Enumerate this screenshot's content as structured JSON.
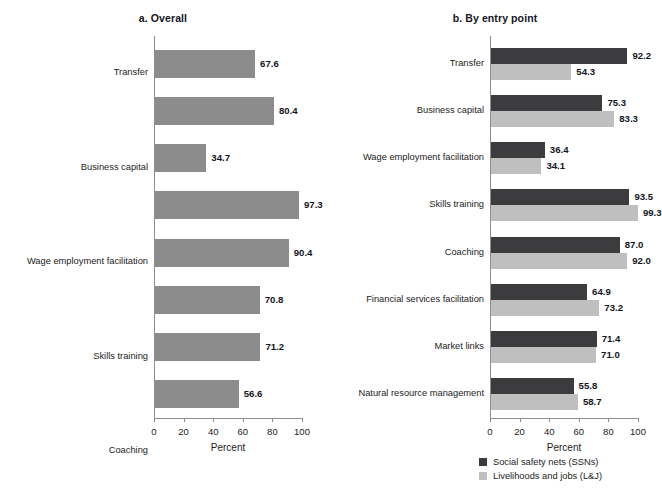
{
  "chart_data": [
    {
      "type": "bar",
      "panel_id": "a",
      "title": "a. Overall",
      "xlabel": "Percent",
      "ylabel": "",
      "xlim": [
        0,
        100
      ],
      "xticks": [
        0,
        20,
        40,
        60,
        80,
        100
      ],
      "xticklabels": [
        "0",
        "20",
        "40",
        "60",
        "80",
        "100"
      ],
      "grid": false,
      "orientation": "horizontal",
      "legend": false,
      "categories": [
        "Transfer",
        "Business capital",
        "Wage employment facilitation",
        "Skills training",
        "Coaching",
        "Financial services facilitation",
        "Market links",
        "Natural resource management"
      ],
      "values": [
        67.6,
        80.4,
        34.7,
        97.3,
        90.4,
        70.8,
        71.2,
        56.6
      ],
      "datalabels": [
        "67.6",
        "80.4",
        "34.7",
        "97.3",
        "90.4",
        "70.8",
        "71.2",
        "56.6"
      ],
      "bar_color": "#8c8c8c"
    },
    {
      "type": "bar",
      "panel_id": "b",
      "title": "b. By entry point",
      "xlabel": "Percent",
      "ylabel": "",
      "xlim": [
        0,
        100
      ],
      "xticks": [
        0,
        20,
        40,
        60,
        80,
        100
      ],
      "xticklabels": [
        "0",
        "20",
        "40",
        "60",
        "80",
        "100"
      ],
      "grid": false,
      "orientation": "horizontal",
      "legend": true,
      "legend_position": "bottom-right",
      "categories": [
        "Transfer",
        "Business capital",
        "Wage employment facilitation",
        "Skills training",
        "Coaching",
        "Financial services facilitation",
        "Market links",
        "Natural resource management"
      ],
      "series": [
        {
          "name": "Social safety nets (SSNs)",
          "color": "#3c3c3f",
          "values": [
            92.2,
            75.3,
            36.4,
            93.5,
            87.0,
            64.9,
            71.4,
            55.8
          ],
          "datalabels": [
            "92.2",
            "75.3",
            "36.4",
            "93.5",
            "87.0",
            "64.9",
            "71.4",
            "55.8"
          ]
        },
        {
          "name": "Livelihoods and jobs (L&J)",
          "color": "#bfbfbf",
          "values": [
            54.3,
            83.3,
            34.1,
            99.3,
            92.0,
            73.2,
            71.0,
            58.7
          ],
          "datalabels": [
            "54.3",
            "83.3",
            "34.1",
            "99.3",
            "92.0",
            "73.2",
            "71.0",
            "58.7"
          ]
        }
      ]
    }
  ],
  "legend": {
    "entries": [
      {
        "label": "Social safety nets (SSNs)",
        "color": "#3c3c3f"
      },
      {
        "label": "Livelihoods and jobs (L&J)",
        "color": "#bfbfbf"
      }
    ]
  }
}
